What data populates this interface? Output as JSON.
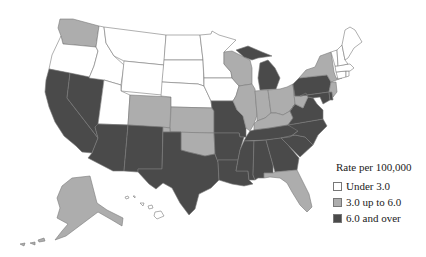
{
  "map": {
    "title": "",
    "legend": {
      "title": "Rate per 100,000",
      "items": [
        {
          "key": "low",
          "label": "Under 3.0",
          "color": "#ffffff"
        },
        {
          "key": "mid",
          "label": "3.0 up to 6.0",
          "color": "#adadad"
        },
        {
          "key": "high",
          "label": "6.0 and over",
          "color": "#4a4a4a"
        }
      ]
    },
    "states": {
      "WA": "mid",
      "OR": "low",
      "CA": "high",
      "NV": "high",
      "ID": "low",
      "MT": "low",
      "WY": "low",
      "UT": "low",
      "AZ": "high",
      "CO": "mid",
      "NM": "high",
      "ND": "low",
      "SD": "low",
      "NE": "low",
      "KS": "mid",
      "OK": "mid",
      "TX": "high",
      "MN": "low",
      "IA": "low",
      "MO": "high",
      "AR": "high",
      "LA": "high",
      "WI": "mid",
      "IL": "mid",
      "MI": "high",
      "IN": "mid",
      "OH": "mid",
      "KY": "mid",
      "TN": "high",
      "MS": "high",
      "AL": "high",
      "GA": "high",
      "FL": "mid",
      "SC": "high",
      "NC": "high",
      "VA": "high",
      "WV": "mid",
      "PA": "high",
      "NY": "mid",
      "MD": "high",
      "DE": "high",
      "NJ": "mid",
      "CT": "low",
      "RI": "low",
      "MA": "low",
      "VT": "low",
      "NH": "low",
      "ME": "low",
      "AK": "mid",
      "HI": "low",
      "DC": "high"
    }
  }
}
